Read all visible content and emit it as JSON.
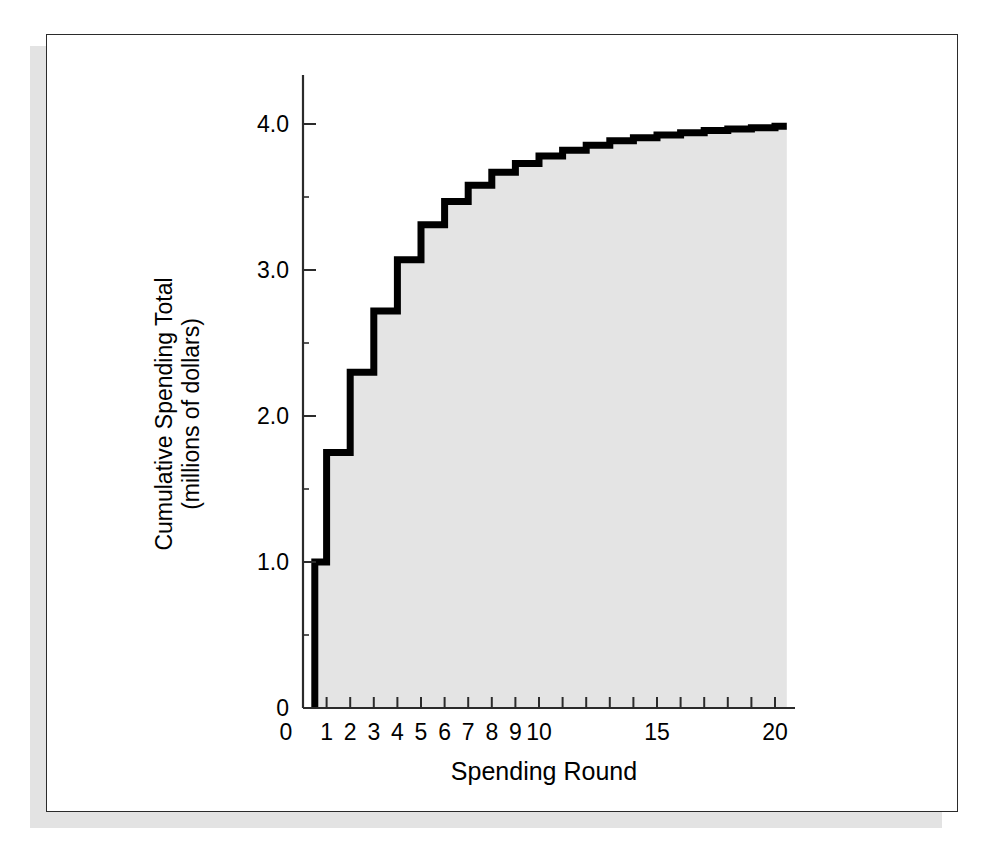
{
  "figure": {
    "frame_color": "#2b2b2b",
    "shadow_color": "#e3e3e3",
    "background_color": "#ffffff"
  },
  "chart_data": {
    "type": "area",
    "subtype": "step-area",
    "title": "",
    "subtitle": "",
    "xlabel": "Spending Round",
    "ylabel": "Cumulative Spending Total\n(millions of dollars)",
    "ylabel_line1": "Cumulative Spending Total",
    "ylabel_line2": "(millions of dollars)",
    "xlim": [
      0,
      20.5
    ],
    "ylim": [
      0,
      4.2
    ],
    "grid": false,
    "legend": false,
    "legend_position": "none",
    "line_color": "#000000",
    "line_width_px": 7,
    "fill_color": "#e4e4e4",
    "axis_color": "#2b2b2b",
    "x_ticks_major": [
      1,
      2,
      3,
      4,
      5,
      6,
      7,
      8,
      9,
      10,
      11,
      12,
      13,
      14,
      15,
      16,
      17,
      18,
      19,
      20
    ],
    "x_tick_labels": [
      {
        "value": 0,
        "label": "0",
        "at_origin": true
      },
      {
        "value": 1,
        "label": "1"
      },
      {
        "value": 2,
        "label": "2"
      },
      {
        "value": 3,
        "label": "3"
      },
      {
        "value": 4,
        "label": "4"
      },
      {
        "value": 5,
        "label": "5"
      },
      {
        "value": 6,
        "label": "6"
      },
      {
        "value": 7,
        "label": "7"
      },
      {
        "value": 8,
        "label": "8"
      },
      {
        "value": 9,
        "label": "9"
      },
      {
        "value": 10,
        "label": "10"
      },
      {
        "value": 15,
        "label": "15"
      },
      {
        "value": 20,
        "label": "20"
      }
    ],
    "y_ticks_major": [
      1.0,
      2.0,
      3.0,
      4.0
    ],
    "y_ticks_minor": [
      0.5,
      1.5,
      2.5,
      3.5
    ],
    "y_tick_labels": [
      {
        "value": 0,
        "label": "0"
      },
      {
        "value": 1.0,
        "label": "1.0"
      },
      {
        "value": 2.0,
        "label": "2.0"
      },
      {
        "value": 3.0,
        "label": "3.0"
      },
      {
        "value": 4.0,
        "label": "4.0"
      }
    ],
    "step_start_x": 0.5,
    "categories": [
      0.5,
      1,
      2,
      3,
      4,
      5,
      6,
      7,
      8,
      9,
      10,
      11,
      12,
      13,
      14,
      15,
      16,
      17,
      18,
      19,
      20
    ],
    "values": [
      1.0,
      1.75,
      2.3,
      2.72,
      3.07,
      3.31,
      3.47,
      3.58,
      3.67,
      3.73,
      3.78,
      3.82,
      3.855,
      3.885,
      3.905,
      3.925,
      3.94,
      3.955,
      3.965,
      3.975,
      3.985
    ],
    "series": [
      {
        "name": "Cumulative Spending Total",
        "x": [
          0.5,
          1,
          2,
          3,
          4,
          5,
          6,
          7,
          8,
          9,
          10,
          11,
          12,
          13,
          14,
          15,
          16,
          17,
          18,
          19,
          20
        ],
        "values": [
          1.0,
          1.75,
          2.3,
          2.72,
          3.07,
          3.31,
          3.47,
          3.58,
          3.67,
          3.73,
          3.78,
          3.82,
          3.855,
          3.885,
          3.905,
          3.925,
          3.94,
          3.955,
          3.965,
          3.975,
          3.985
        ]
      }
    ],
    "end_x": 20.5
  },
  "geometry": {
    "x_axis_y_px": 708,
    "y_axis_x_px": 303,
    "px_per_x_unit": 23.6,
    "px_per_y_unit": 146,
    "x_right_px": 795,
    "y_top_px": 75
  }
}
